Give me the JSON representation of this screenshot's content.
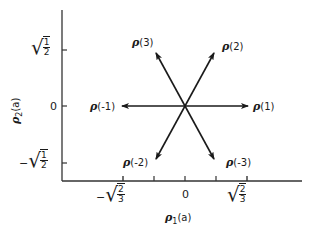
{
  "diagram": {
    "x_axis": {
      "label_symbol": "ρ",
      "label_sub": "1",
      "label_arg": "(a)",
      "ticks": [
        {
          "sign": "−",
          "num": "2",
          "den": "3",
          "x": 123
        },
        {
          "text": "",
          "x": 154
        },
        {
          "text": "0",
          "x": 185
        },
        {
          "text": "",
          "x": 216
        },
        {
          "sign": "",
          "num": "2",
          "den": "3",
          "x": 247
        }
      ]
    },
    "y_axis": {
      "label_symbol": "ρ",
      "label_sub": "2",
      "label_arg": "(a)",
      "ticks": [
        {
          "sign": "",
          "num": "1",
          "den": "2",
          "y": 50
        },
        {
          "text": "0",
          "y": 106
        },
        {
          "sign": "−",
          "num": "1",
          "den": "2",
          "y": 163
        }
      ]
    },
    "vectors": [
      {
        "name": "ρ(1)",
        "symbol": "ρ",
        "index": "(1)",
        "tip": [
          248,
          106
        ]
      },
      {
        "name": "ρ(2)",
        "symbol": "ρ",
        "index": "(2)",
        "tip": [
          214,
          53
        ]
      },
      {
        "name": "ρ(3)",
        "symbol": "ρ",
        "index": "(3)",
        "tip": [
          156,
          53
        ]
      },
      {
        "name": "ρ(-1)",
        "symbol": "ρ",
        "index": "(-1)",
        "tip": [
          122,
          106
        ]
      },
      {
        "name": "ρ(-2)",
        "symbol": "ρ",
        "index": "(-2)",
        "tip": [
          156,
          159
        ]
      },
      {
        "name": "ρ(-3)",
        "symbol": "ρ",
        "index": "(-3)",
        "tip": [
          214,
          159
        ]
      }
    ],
    "origin": [
      185,
      106
    ]
  }
}
